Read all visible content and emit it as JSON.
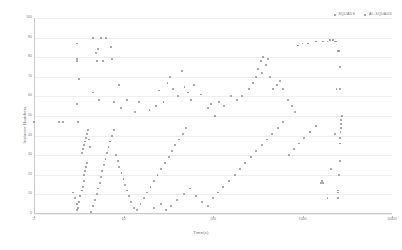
{
  "chart_data": {
    "type": "scatter",
    "title": "",
    "xlabel": "Time(s)",
    "ylabel": "Instance Numbers",
    "xscale": "log",
    "yscale": "linear",
    "xlim": [
      1,
      10000
    ],
    "ylim": [
      0,
      100
    ],
    "xticks": [
      1,
      10,
      100,
      1000,
      10000
    ],
    "xtick_labels": [
      "1",
      "10",
      "100",
      "1000",
      "10000"
    ],
    "yticks": [
      0,
      10,
      20,
      30,
      40,
      50,
      60,
      70,
      80,
      90,
      100
    ],
    "ytick_labels": [
      "0",
      "10",
      "20",
      "30",
      "40",
      "50",
      "60",
      "70",
      "80",
      "90",
      "100"
    ],
    "grid": true,
    "grid_axis": "y",
    "legend_position": "top-right",
    "marker_color": "#8e8e96",
    "grid_color": "#ededf2",
    "axis_color": "#c9c9cf",
    "series": [
      {
        "name": "SQUADS",
        "color": "#8e8e96",
        "points": [
          [
            1.0,
            47
          ],
          [
            1.9,
            47
          ],
          [
            2.1,
            47
          ],
          [
            3.1,
            47
          ],
          [
            3.0,
            56
          ],
          [
            3.0,
            87
          ],
          [
            3.0,
            79
          ],
          [
            3.0,
            78
          ],
          [
            3.2,
            69
          ],
          [
            4.6,
            90
          ],
          [
            4.9,
            82
          ],
          [
            5.2,
            84
          ],
          [
            5.6,
            90
          ],
          [
            6.4,
            90
          ],
          [
            5.0,
            78
          ],
          [
            5.9,
            78
          ],
          [
            7.2,
            85
          ],
          [
            7.4,
            79
          ],
          [
            4.6,
            62
          ],
          [
            5.3,
            58
          ],
          [
            7.9,
            57
          ],
          [
            8.9,
            66
          ],
          [
            9.4,
            54
          ],
          [
            11.0,
            58
          ],
          [
            13.5,
            52
          ],
          [
            15.0,
            57
          ],
          [
            19.5,
            53
          ],
          [
            23.0,
            55
          ],
          [
            25.0,
            63
          ],
          [
            28.0,
            57
          ],
          [
            31.0,
            67
          ],
          [
            33.0,
            70
          ],
          [
            36.0,
            64
          ],
          [
            41.0,
            60
          ],
          [
            45.0,
            73
          ],
          [
            48.0,
            65
          ],
          [
            52.0,
            62
          ],
          [
            57.0,
            58
          ],
          [
            62.0,
            66
          ],
          [
            73.0,
            61
          ],
          [
            88.0,
            54
          ],
          [
            96.0,
            56
          ],
          [
            105.0,
            50
          ],
          [
            118.0,
            57
          ],
          [
            132.0,
            55
          ],
          [
            160.0,
            60
          ],
          [
            185.0,
            58
          ],
          [
            210.0,
            60
          ],
          [
            255.0,
            64
          ],
          [
            280.0,
            67
          ],
          [
            300.0,
            70
          ],
          [
            320.0,
            74
          ],
          [
            340.0,
            78
          ],
          [
            350.0,
            72
          ],
          [
            360.0,
            80
          ],
          [
            395.0,
            76
          ],
          [
            410.0,
            79
          ],
          [
            430.0,
            70
          ],
          [
            470.0,
            64
          ],
          [
            520.0,
            66
          ],
          [
            560.0,
            68
          ],
          [
            610.0,
            64
          ],
          [
            690.0,
            58
          ],
          [
            760.0,
            55
          ],
          [
            830.0,
            52
          ],
          [
            900.0,
            86
          ],
          [
            1000.0,
            87
          ],
          [
            1150.0,
            87
          ],
          [
            1400.0,
            88
          ],
          [
            1700.0,
            88
          ],
          [
            1900.0,
            88
          ],
          [
            2050.0,
            89
          ],
          [
            2200.0,
            89
          ],
          [
            2300.0,
            88
          ],
          [
            2400.0,
            88
          ],
          [
            2500.0,
            83
          ],
          [
            2550.0,
            83
          ],
          [
            2600.0,
            75
          ],
          [
            2620.0,
            64
          ],
          [
            2400.0,
            64
          ]
        ]
      },
      {
        "name": "AL-SQUADS",
        "color": "#8e8e96",
        "points": [
          [
            3.0,
            2
          ],
          [
            3.2,
            6
          ],
          [
            3.3,
            9
          ],
          [
            3.4,
            12
          ],
          [
            3.5,
            14
          ],
          [
            3.6,
            17
          ],
          [
            3.6,
            20
          ],
          [
            3.7,
            22
          ],
          [
            3.8,
            24
          ],
          [
            3.9,
            26
          ],
          [
            3.4,
            31
          ],
          [
            3.5,
            33
          ],
          [
            3.6,
            35
          ],
          [
            3.7,
            37
          ],
          [
            3.8,
            39
          ],
          [
            3.9,
            41
          ],
          [
            4.0,
            43
          ],
          [
            4.1,
            38
          ],
          [
            4.2,
            34
          ],
          [
            2.7,
            11
          ],
          [
            2.9,
            8
          ],
          [
            3.0,
            5
          ],
          [
            3.1,
            3
          ],
          [
            4.3,
            1
          ],
          [
            4.6,
            4
          ],
          [
            4.8,
            7
          ],
          [
            5.0,
            10
          ],
          [
            5.2,
            13
          ],
          [
            5.4,
            16
          ],
          [
            5.6,
            19
          ],
          [
            5.8,
            22
          ],
          [
            6.0,
            25
          ],
          [
            6.3,
            28
          ],
          [
            6.5,
            31
          ],
          [
            6.8,
            34
          ],
          [
            7.0,
            37
          ],
          [
            7.4,
            40
          ],
          [
            7.8,
            43
          ],
          [
            8.2,
            30
          ],
          [
            8.6,
            27
          ],
          [
            9.0,
            24
          ],
          [
            9.5,
            21
          ],
          [
            10.0,
            18
          ],
          [
            10.5,
            15
          ],
          [
            11.0,
            12
          ],
          [
            11.5,
            9
          ],
          [
            12.0,
            6
          ],
          [
            13.0,
            3
          ],
          [
            14.0,
            2
          ],
          [
            15.5,
            5
          ],
          [
            17.0,
            8
          ],
          [
            18.5,
            11
          ],
          [
            20.0,
            14
          ],
          [
            22.0,
            17
          ],
          [
            24.0,
            20
          ],
          [
            26.0,
            23
          ],
          [
            29.0,
            26
          ],
          [
            32.0,
            29
          ],
          [
            35.0,
            32
          ],
          [
            38.0,
            35
          ],
          [
            42.0,
            38
          ],
          [
            46.0,
            41
          ],
          [
            50.0,
            44
          ],
          [
            22.0,
            3
          ],
          [
            26.0,
            5
          ],
          [
            30.0,
            2
          ],
          [
            34.0,
            4
          ],
          [
            40.0,
            7
          ],
          [
            47.0,
            10
          ],
          [
            55.0,
            13
          ],
          [
            64.0,
            9
          ],
          [
            75.0,
            6
          ],
          [
            88.0,
            4
          ],
          [
            100.0,
            8
          ],
          [
            115.0,
            11
          ],
          [
            130.0,
            14
          ],
          [
            150.0,
            17
          ],
          [
            175.0,
            20
          ],
          [
            200.0,
            23
          ],
          [
            230.0,
            26
          ],
          [
            265.0,
            29
          ],
          [
            305.0,
            32
          ],
          [
            350.0,
            35
          ],
          [
            400.0,
            38
          ],
          [
            460.0,
            41
          ],
          [
            530.0,
            44
          ],
          [
            610.0,
            47
          ],
          [
            700.0,
            30
          ],
          [
            800.0,
            33
          ],
          [
            920.0,
            36
          ],
          [
            1050.0,
            39
          ],
          [
            1200.0,
            42
          ],
          [
            1400.0,
            45
          ],
          [
            1600.0,
            16
          ],
          [
            1650.0,
            17
          ],
          [
            1700.0,
            16
          ],
          [
            1900.0,
            8
          ],
          [
            2100.0,
            23
          ],
          [
            2300.0,
            41
          ],
          [
            2500.0,
            12
          ],
          [
            2550.0,
            20
          ],
          [
            2600.0,
            27
          ],
          [
            2620.0,
            36
          ],
          [
            2640.0,
            39
          ],
          [
            2660.0,
            42
          ],
          [
            2680.0,
            44
          ],
          [
            2700.0,
            46
          ],
          [
            2720.0,
            48
          ],
          [
            2740.0,
            50
          ],
          [
            2500.0,
            8
          ],
          [
            2520.0,
            11
          ]
        ]
      }
    ]
  },
  "legend": {
    "entries": [
      {
        "label": "SQUADS"
      },
      {
        "label": "AL-SQUADS"
      }
    ]
  }
}
